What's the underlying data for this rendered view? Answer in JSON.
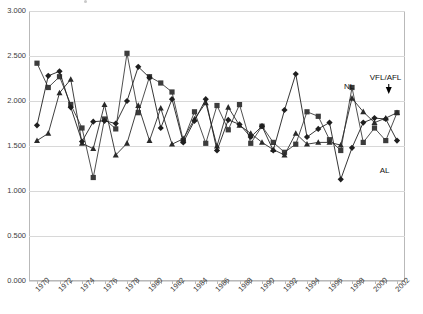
{
  "chart_data": {
    "type": "line",
    "title": "",
    "xlabel": "",
    "ylabel": "",
    "ylim": [
      0,
      3000
    ],
    "xlim": [
      1970,
      2002
    ],
    "grid": true,
    "legend_position": "inline-annotations",
    "ytick_labels": [
      "3.000",
      "2.500",
      "2.000",
      "1.500",
      "1.000",
      "0.500",
      "0.000"
    ],
    "ytick_values": [
      3000,
      2500,
      2000,
      1500,
      1000,
      500,
      0
    ],
    "xtick_labels": [
      "1970",
      "1972",
      "1974",
      "1976",
      "1978",
      "1980",
      "1982",
      "1984",
      "1986",
      "1988",
      "1990",
      "1992",
      "1994",
      "1996",
      "1998",
      "2000",
      "2002"
    ],
    "x": [
      1970,
      1971,
      1972,
      1973,
      1974,
      1975,
      1976,
      1977,
      1978,
      1979,
      1980,
      1981,
      1982,
      1983,
      1984,
      1985,
      1986,
      1987,
      1988,
      1989,
      1990,
      1991,
      1992,
      1993,
      1994,
      1995,
      1996,
      1997,
      1998,
      1999,
      2000,
      2001,
      2002
    ],
    "series": [
      {
        "name": "VFL/AFL",
        "marker": "square",
        "color": "#3c3c3c",
        "values": [
          2420,
          2150,
          2270,
          1960,
          1700,
          1150,
          1800,
          1690,
          2530,
          1870,
          2270,
          2200,
          2100,
          1560,
          1880,
          1530,
          1950,
          1680,
          1960,
          1530,
          1720,
          1540,
          1430,
          1520,
          1880,
          1830,
          1570,
          1450,
          2150,
          1540,
          1700,
          1560,
          1870
        ]
      },
      {
        "name": "NL",
        "marker": "triangle",
        "color": "#2a2a2a",
        "values": [
          1560,
          1640,
          2090,
          2240,
          1530,
          1470,
          1960,
          1400,
          1530,
          1950,
          1560,
          1920,
          1520,
          1580,
          1800,
          1980,
          1500,
          1930,
          1730,
          1640,
          1540,
          1460,
          1400,
          1640,
          1520,
          1540,
          1540,
          1510,
          2030,
          1880,
          1760,
          1810,
          1870
        ]
      },
      {
        "name": "AL",
        "marker": "diamond",
        "color": "#1f1f1f",
        "values": [
          1730,
          2280,
          2330,
          1930,
          1550,
          1770,
          1780,
          1750,
          2000,
          2380,
          2260,
          1700,
          2020,
          1540,
          1780,
          2020,
          1450,
          1790,
          1740,
          1600,
          1720,
          1450,
          1900,
          2300,
          1600,
          1690,
          1760,
          1130,
          1480,
          1760,
          1810,
          1800,
          1560
        ]
      }
    ],
    "annotations": [
      {
        "text": "NL",
        "x": 1998,
        "y": 2030
      },
      {
        "text": "VFL/AFL",
        "x": 2001,
        "y": 2100
      },
      {
        "text": "AL",
        "x": 2001,
        "y": 1300
      }
    ]
  }
}
